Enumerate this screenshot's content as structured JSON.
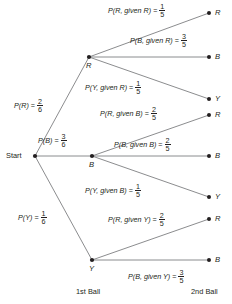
{
  "diagram": {
    "start_label": "Start",
    "axis": {
      "first": "1st Ball",
      "second": "2nd Ball"
    },
    "colors": {
      "ink": "#231f20",
      "line": "#6d6e71",
      "background": "#ffffff"
    },
    "stage1": {
      "nodes": [
        {
          "letter": "R",
          "prob_lhs": "P(R)",
          "eq": "=",
          "num": "2",
          "den": "6"
        },
        {
          "letter": "B",
          "prob_lhs": "P(B)",
          "eq": "=",
          "num": "3",
          "den": "6"
        },
        {
          "letter": "Y",
          "prob_lhs": "P(Y)",
          "eq": "=",
          "num": "1",
          "den": "6"
        }
      ]
    },
    "stage2": {
      "from_R": [
        {
          "letter": "R",
          "prob_lhs": "P(R, given R)",
          "eq": "=",
          "num": "1",
          "den": "5"
        },
        {
          "letter": "B",
          "prob_lhs": "P(B, given R)",
          "eq": "=",
          "num": "3",
          "den": "5"
        },
        {
          "letter": "Y",
          "prob_lhs": "P(Y, given R)",
          "eq": "=",
          "num": "1",
          "den": "5"
        }
      ],
      "from_B": [
        {
          "letter": "R",
          "prob_lhs": "P(R, given B)",
          "eq": "=",
          "num": "2",
          "den": "5"
        },
        {
          "letter": "B",
          "prob_lhs": "P(B, given B)",
          "eq": "=",
          "num": "2",
          "den": "5"
        },
        {
          "letter": "Y",
          "prob_lhs": "P(Y, given B)",
          "eq": "=",
          "num": "1",
          "den": "5"
        }
      ],
      "from_Y": [
        {
          "letter": "R",
          "prob_lhs": "P(R, given Y)",
          "eq": "=",
          "num": "2",
          "den": "5"
        },
        {
          "letter": "B",
          "prob_lhs": "P(B, given Y)",
          "eq": "=",
          "num": "3",
          "den": "5"
        }
      ]
    }
  }
}
